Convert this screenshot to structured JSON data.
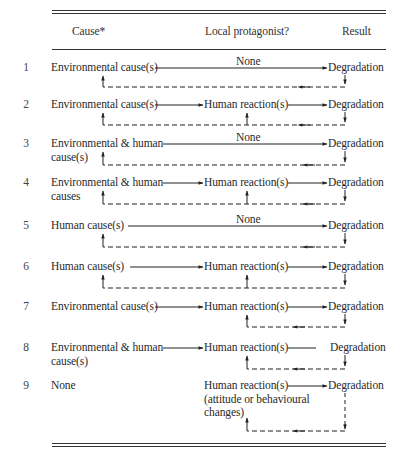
{
  "header": {
    "cause": "Cause*",
    "protagonist": "Local protagonist?",
    "result": "Result"
  },
  "rows": [
    {
      "num": "1",
      "cause_line1": "Environmental cause(s)",
      "cause_line2": "",
      "protagonist": "None",
      "result": "Degradation",
      "feedback_to": "cause"
    },
    {
      "num": "2",
      "cause_line1": "Environmental cause(s)",
      "cause_line2": "",
      "protagonist": "Human reaction(s)",
      "result": "Degradation",
      "feedback_to": "cause+protagonist"
    },
    {
      "num": "3",
      "cause_line1": "Environmental & human",
      "cause_line2": "cause(s)",
      "protagonist": "None",
      "result": "Degradation",
      "feedback_to": "cause"
    },
    {
      "num": "4",
      "cause_line1": "Environmental & human",
      "cause_line2": "causes",
      "protagonist": "Human reaction(s)",
      "result": "Degradation",
      "feedback_to": "cause+protagonist"
    },
    {
      "num": "5",
      "cause_line1": "Human cause(s)",
      "cause_line2": "",
      "protagonist": "None",
      "result": "Degradation",
      "feedback_to": "cause"
    },
    {
      "num": "6",
      "cause_line1": "Human cause(s)",
      "cause_line2": "",
      "protagonist": "Human reaction(s)",
      "result": "Degradation",
      "feedback_to": "cause+protagonist"
    },
    {
      "num": "7",
      "cause_line1": "Environmental cause(s)",
      "cause_line2": "",
      "protagonist": "Human reaction(s)",
      "result": "Degradation",
      "feedback_to": "protagonist"
    },
    {
      "num": "8",
      "cause_line1": "Environmental & human",
      "cause_line2": "cause(s)",
      "protagonist": "Human reaction(s)",
      "result": "Degradation",
      "feedback_to": "protagonist"
    },
    {
      "num": "9",
      "cause_line1": "None",
      "cause_line2": "",
      "protagonist": "Human reaction(s)",
      "protagonist_line2": "(attitude or behavioural",
      "protagonist_line3": "changes)",
      "result": "Degradation",
      "feedback_to": "protagonist"
    }
  ]
}
